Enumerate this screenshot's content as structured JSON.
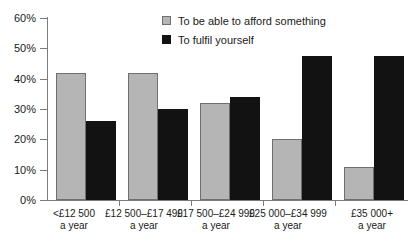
{
  "chart_data": {
    "type": "bar",
    "title": "",
    "xlabel": "",
    "ylabel": "",
    "ylim": [
      0,
      60
    ],
    "yticks": [
      0,
      10,
      20,
      30,
      40,
      50,
      60
    ],
    "ytick_labels": [
      "0%",
      "10%",
      "20%",
      "30%",
      "40%",
      "50%",
      "60%"
    ],
    "grid": false,
    "legend_position": "top-right",
    "categories": [
      "<£12 500 a year",
      "£12 500–£17 499 a year",
      "£17 500–£24 999 a year",
      "£25 000–£34 999 a year",
      "£35 000+ a year"
    ],
    "category_lines": [
      [
        "<£12 500",
        "a year"
      ],
      [
        "£12 500–£17 499",
        "a year"
      ],
      [
        "£17 500–£24 999",
        "a year"
      ],
      [
        "£25 000–£34 999",
        "a year"
      ],
      [
        "£35 000+",
        "a year"
      ]
    ],
    "series": [
      {
        "name": "To be able to afford something",
        "color": "#b5b5b5",
        "values": [
          42,
          42,
          32,
          20,
          11
        ]
      },
      {
        "name": "To fulfil yourself",
        "color": "#121212",
        "values": [
          26,
          30,
          34,
          47.5,
          47.5
        ]
      }
    ]
  },
  "legend": {
    "items": [
      {
        "label": "To be able to afford something",
        "swatch": "legend-swatch-grey"
      },
      {
        "label": "To fulfil yourself",
        "swatch": "legend-swatch-black"
      }
    ]
  },
  "axes": {
    "y": {
      "labels": [
        "60%",
        "50%",
        "40%",
        "30%",
        "20%",
        "10%",
        "0%"
      ]
    }
  }
}
